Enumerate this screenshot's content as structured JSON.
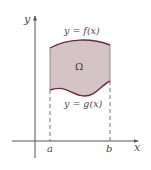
{
  "figure": {
    "type": "region-between-curves",
    "labels": {
      "y_axis": "y",
      "x_axis": "x",
      "upper_curve": "y = f(x)",
      "lower_curve": "y = g(x)",
      "region": "Ω",
      "left_bound": "a",
      "right_bound": "b"
    },
    "colors": {
      "region_fill": "#d4c4c8",
      "curve_stroke": "#6b2a3a",
      "axis_stroke": "#555555",
      "dashed_stroke": "#666666"
    }
  }
}
